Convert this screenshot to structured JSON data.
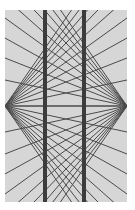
{
  "figure": {
    "name": "Hering illusion",
    "background_color": "#ffffff",
    "panel": {
      "x": 5,
      "y": 10,
      "width": 122,
      "height": 192,
      "color": "#d6d6d6"
    },
    "rays": {
      "color": "#4a4a4a",
      "width": 1,
      "left_focus": [
        5,
        106
      ],
      "right_focus": [
        127,
        106
      ],
      "center_x": 66,
      "center_offsets": [
        -88,
        -79,
        -71,
        -63,
        -54,
        -44,
        -34,
        -24,
        -13,
        0,
        13,
        24,
        34,
        44,
        54,
        63,
        71,
        79,
        88
      ]
    },
    "bars": {
      "color": "#3c3c3c",
      "width": 4,
      "positions_x": [
        45,
        84
      ]
    }
  }
}
